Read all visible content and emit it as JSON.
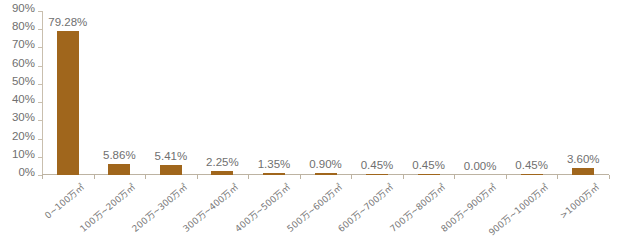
{
  "chart_data": {
    "type": "bar",
    "title": "",
    "subtitle": "",
    "xlabel": "",
    "ylabel": "",
    "ylim": [
      0,
      90
    ],
    "grid": false,
    "legend": null,
    "bar_color": "#A0661C",
    "axis_color": "#C1B6A4",
    "text_color": "#6F6F6F",
    "y_ticks": [
      "0%",
      "10%",
      "20%",
      "30%",
      "40%",
      "50%",
      "60%",
      "70%",
      "80%",
      "90%"
    ],
    "y_tick_values": [
      0,
      10,
      20,
      30,
      40,
      50,
      60,
      70,
      80,
      90
    ],
    "categories": [
      "0~100万㎡",
      "100万~200万㎡",
      "200万~300万㎡",
      "300万~400万㎡",
      "400万~500万㎡",
      "500万~600万㎡",
      "600万~700万㎡",
      "700万~800万㎡",
      "800万~900万㎡",
      "900万~1000万㎡",
      ">1000万㎡"
    ],
    "values": [
      79.28,
      5.86,
      5.41,
      2.25,
      1.35,
      0.9,
      0.45,
      0.45,
      0.0,
      0.45,
      3.6
    ],
    "value_labels": [
      "79.28%",
      "5.86%",
      "5.41%",
      "2.25%",
      "1.35%",
      "0.90%",
      "0.45%",
      "0.45%",
      "0.00%",
      "0.45%",
      "3.60%"
    ]
  }
}
